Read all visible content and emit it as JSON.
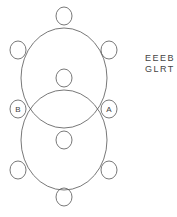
{
  "diagram": {
    "large_circles": [
      {
        "cx": 64,
        "cy": 78,
        "rx": 43,
        "ry": 50
      },
      {
        "cx": 64,
        "cy": 140,
        "rx": 43,
        "ry": 50
      }
    ],
    "small_circles": [
      {
        "cx": 64,
        "cy": 16,
        "label": ""
      },
      {
        "cx": 18,
        "cy": 50,
        "label": ""
      },
      {
        "cx": 109,
        "cy": 50,
        "label": ""
      },
      {
        "cx": 64,
        "cy": 78,
        "label": ""
      },
      {
        "cx": 18,
        "cy": 109,
        "label": "B"
      },
      {
        "cx": 109,
        "cy": 109,
        "label": "A"
      },
      {
        "cx": 64,
        "cy": 140,
        "label": ""
      },
      {
        "cx": 18,
        "cy": 170,
        "label": ""
      },
      {
        "cx": 109,
        "cy": 170,
        "label": ""
      },
      {
        "cx": 64,
        "cy": 197,
        "label": ""
      }
    ],
    "labels": {
      "left": "B",
      "right": "A"
    },
    "code_lines": [
      "EEEB",
      "GLRT"
    ],
    "stroke_color": "#555555"
  }
}
